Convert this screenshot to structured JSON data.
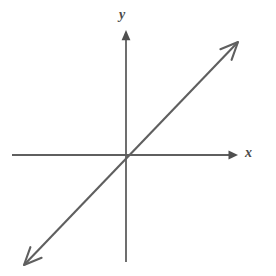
{
  "figure": {
    "kind": "cartesian-coordinate-plane",
    "width": 276,
    "height": 276,
    "background_color": "#ffffff",
    "stroke_color": "#5f5f5f",
    "label_color": "#4a4a4a"
  },
  "labels": {
    "y_axis": "y",
    "x_axis": "x"
  },
  "chart_data": {
    "type": "line",
    "title": "",
    "subtitle": "",
    "xlabel": "x",
    "ylabel": "y",
    "xlim": [
      -10,
      10
    ],
    "ylim": [
      -10,
      10
    ],
    "grid": false,
    "legend": null,
    "annotations": [],
    "axes": {
      "x_axis": {
        "label": "x",
        "orientation": "horizontal",
        "tick_labels": [],
        "ticks": [],
        "arrow_start": false,
        "arrow_end": true,
        "pixel_y": 155,
        "pixel_x_start": 12,
        "pixel_x_end": 238
      },
      "y_axis": {
        "label": "y",
        "orientation": "vertical",
        "tick_labels": [],
        "ticks": [],
        "arrow_start": true,
        "arrow_end": false,
        "pixel_x": 126,
        "pixel_y_top": 30,
        "pixel_y_bottom": 262
      }
    },
    "series": [
      {
        "name": "y = x",
        "equation": "y = x",
        "slope": 1,
        "intercept": 0,
        "color": "#5f5f5f",
        "arrow_start": true,
        "arrow_end": true,
        "x": [
          -9.2,
          9.6
        ],
        "values": [
          -9.2,
          9.6
        ],
        "pixel_start": [
          24,
          265
        ],
        "pixel_end": [
          238,
          42
        ]
      }
    ]
  }
}
